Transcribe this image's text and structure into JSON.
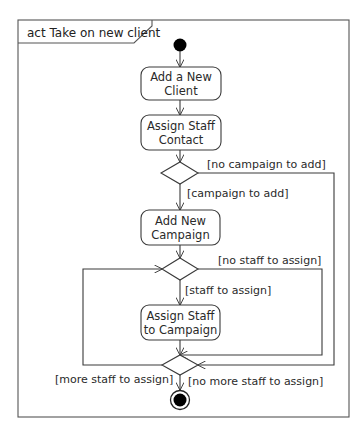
{
  "diagram": {
    "type": "UML activity diagram",
    "frame_title": "act Take on new client",
    "nodes": {
      "initial": {
        "kind": "initial-node"
      },
      "add_client": {
        "kind": "action",
        "line1": "Add a New",
        "line2": "Client"
      },
      "assign_contact": {
        "kind": "action",
        "line1": "Assign Staff",
        "line2": "Contact"
      },
      "decision_campaign": {
        "kind": "decision"
      },
      "add_campaign": {
        "kind": "action",
        "line1": "Add New",
        "line2": "Campaign"
      },
      "decision_staff": {
        "kind": "decision"
      },
      "assign_staff_campaign": {
        "kind": "action",
        "line1": "Assign Staff",
        "line2": "to Campaign"
      },
      "decision_more_staff": {
        "kind": "decision/merge"
      },
      "final": {
        "kind": "activity-final-node"
      }
    },
    "guards": {
      "no_campaign": "[no campaign to add]",
      "campaign": "[campaign to add]",
      "no_staff": "[no staff to assign]",
      "staff": "[staff to assign]",
      "more_staff": "[more staff to assign]",
      "no_more_staff": "[no more staff to assign]"
    }
  },
  "colors": {
    "line": "#3a3a3a",
    "background": "#ffffff",
    "node_fill": "#000000"
  }
}
